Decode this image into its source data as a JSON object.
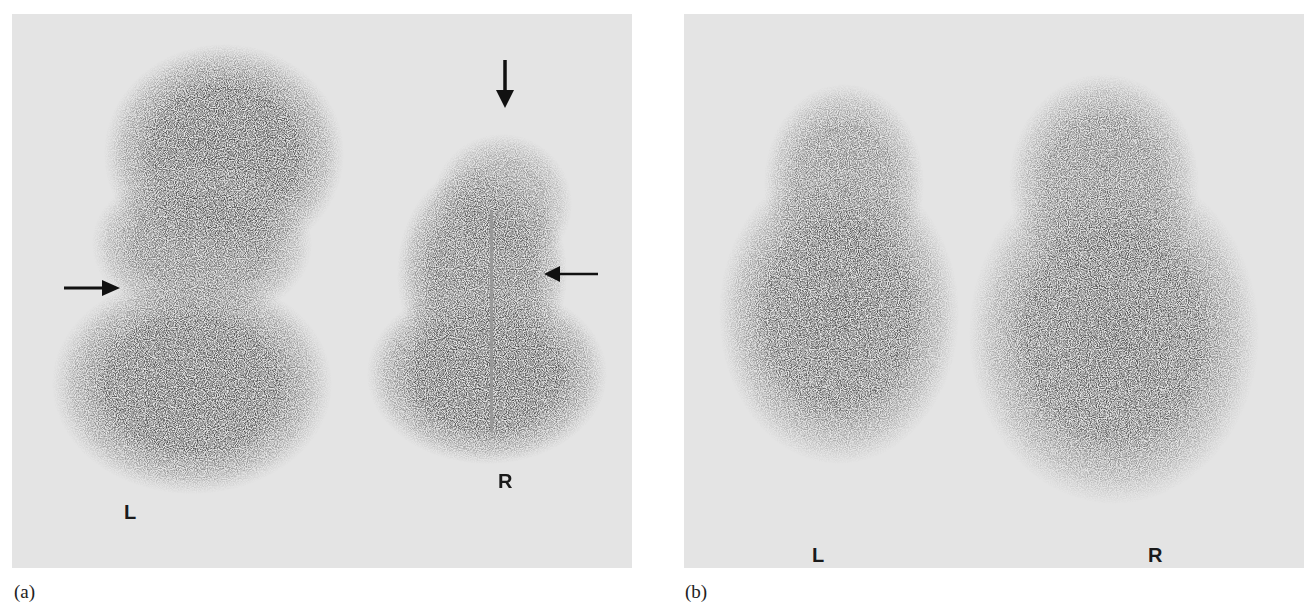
{
  "figure": {
    "panels": [
      {
        "id": "a",
        "caption": "(a)",
        "labels": {
          "left": "L",
          "right": "R"
        },
        "arrows": [
          {
            "name": "arrow-right-pointing",
            "direction": "right",
            "x": 65,
            "y": 287
          },
          {
            "name": "arrow-down-pointing",
            "direction": "down",
            "x": 503,
            "y": 90
          },
          {
            "name": "arrow-left-pointing",
            "direction": "left",
            "x": 545,
            "y": 272
          }
        ],
        "colors": {
          "background": "#e6e6e6",
          "uptake": "#141414"
        }
      },
      {
        "id": "b",
        "caption": "(b)",
        "labels": {
          "left": "L",
          "right": "R"
        },
        "colors": {
          "background": "#e6e6e6",
          "uptake": "#141414"
        }
      }
    ]
  }
}
